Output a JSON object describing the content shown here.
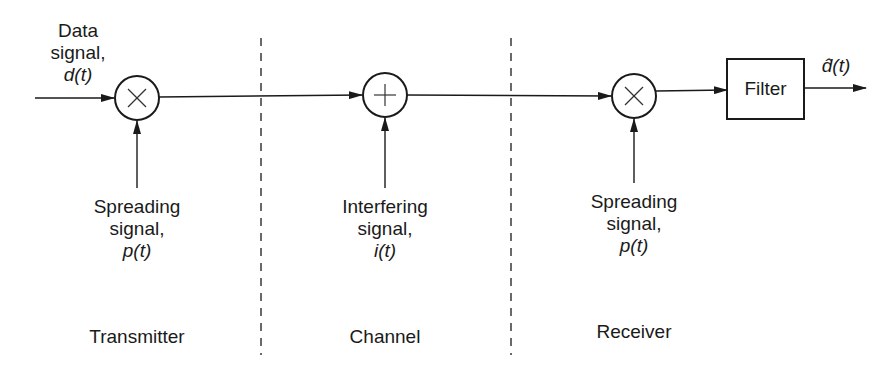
{
  "diagram": {
    "inputs": {
      "data_signal": {
        "line1": "Data",
        "line2": "signal,",
        "symbol": "d(t)"
      }
    },
    "blocks": {
      "tx_multiplier": {
        "symbol": "×",
        "type": "multiplier"
      },
      "channel_adder": {
        "symbol": "+",
        "type": "adder"
      },
      "rx_multiplier": {
        "symbol": "×",
        "type": "multiplier"
      },
      "filter": {
        "label": "Filter"
      }
    },
    "side_inputs": [
      {
        "line1": "Spreading",
        "line2": "signal,",
        "symbol": "p(t)"
      },
      {
        "line1": "Interfering",
        "line2": "signal,",
        "symbol": "i(t)"
      },
      {
        "line1": "Spreading",
        "line2": "signal,",
        "symbol": "p(t)"
      }
    ],
    "output": {
      "symbol": "d̂(t)"
    },
    "sections": [
      "Transmitter",
      "Channel",
      "Receiver"
    ],
    "colors": {
      "line": "#1a1a1a",
      "background": "#ffffff"
    }
  }
}
